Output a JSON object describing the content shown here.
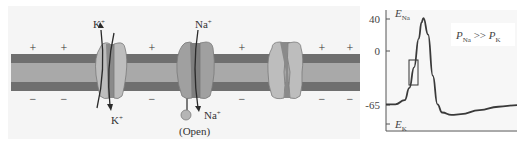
{
  "membrane": {
    "colors": {
      "background": "#f6f6f6",
      "membrane_outer": "#6f6f6f",
      "membrane_core": "#a9a9a9",
      "channel_light": "#bdbdbd",
      "channel_dark": "#8a8a8a",
      "channel_outline": "#7a7a7a",
      "arrow": "#2a2a2a"
    },
    "outside_charge": "+",
    "inside_charge": "−",
    "channels": [
      {
        "type": "potassium",
        "state": "open",
        "ion_top": "K",
        "ion_bottom": "K",
        "charge": "+"
      },
      {
        "type": "sodium",
        "state": "open",
        "ion_top": "Na",
        "ion_bottom": "Na",
        "charge": "+",
        "label": "(Open)"
      },
      {
        "type": "sodium",
        "state": "closed"
      }
    ]
  },
  "chart_data": {
    "type": "line",
    "title": "",
    "xlabel": "",
    "ylabel": "",
    "y_ticks": [
      40,
      0,
      -65
    ],
    "ylim": [
      -90,
      50
    ],
    "annotations": [
      {
        "text": "E_Na",
        "main": "E",
        "sub": "Na",
        "at_y": 40
      },
      {
        "text": "E_K",
        "main": "E",
        "sub": "K",
        "at_y": -83
      },
      {
        "text": "P_Na >> P_K",
        "left": "P",
        "left_sub": "Na",
        "op": ">>",
        "right": "P",
        "right_sub": "K"
      }
    ],
    "highlight_box": {
      "y_range": [
        -35,
        -13
      ],
      "description": "rising phase box"
    },
    "series": [
      {
        "name": "membrane potential",
        "x": [
          0,
          10,
          20,
          25,
          30,
          35,
          38,
          40,
          45,
          50,
          55,
          60,
          70,
          80,
          100,
          120,
          140
        ],
        "values": [
          -65,
          -65,
          -60,
          -45,
          -20,
          15,
          35,
          40,
          20,
          -30,
          -65,
          -75,
          -78,
          -77,
          -72,
          -68,
          -66
        ]
      }
    ],
    "grid": false,
    "legend": "none"
  }
}
